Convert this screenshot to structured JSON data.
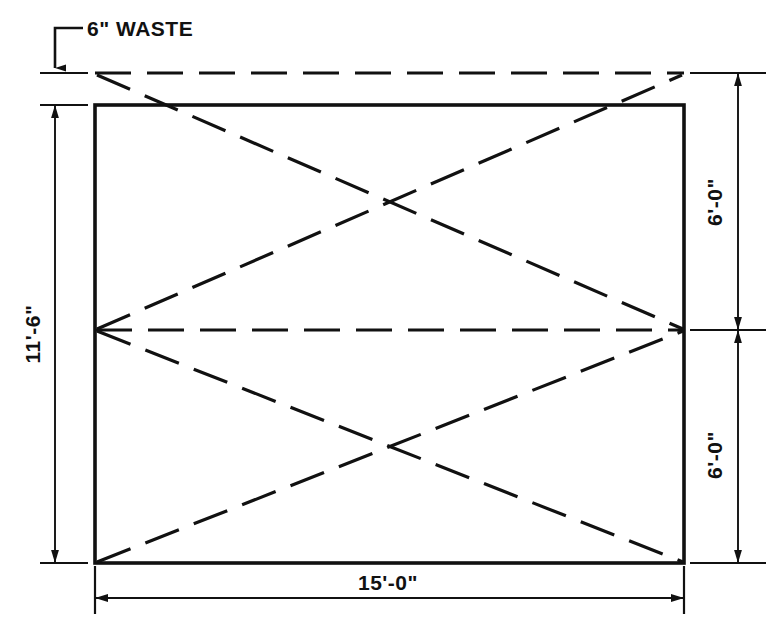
{
  "drawing": {
    "title": "Sheet metal layout with waste allowance",
    "background_color": "#ffffff",
    "line_color": "#111111",
    "annotations": {
      "waste_note": "6\" WASTE",
      "left_dimension": "11'-6\"",
      "bottom_dimension": "15'-0\"",
      "right_dimension_upper": "6'-0\"",
      "right_dimension_lower": "6'-0\""
    },
    "geometry": {
      "panel": {
        "left_x": 95,
        "right_x": 684,
        "top_y": 105,
        "bottom_y": 563,
        "style": "solid"
      },
      "waste_line": {
        "y": 73,
        "from_x": 95,
        "to_x": 684,
        "style": "dashed"
      },
      "centerline": {
        "y": 330,
        "from_x": 95,
        "to_x": 684,
        "style": "dashed"
      },
      "fold_lines_style": "dashed",
      "upper_cross_center": {
        "x": 386,
        "y": 203
      },
      "lower_cross_center": {
        "x": 388,
        "y": 446
      }
    },
    "dimension_lines": {
      "left": {
        "x": 55,
        "top_y": 105,
        "bottom_y": 563
      },
      "right": {
        "x": 738,
        "top_y": 73,
        "mid_y": 330,
        "bottom_y": 563
      },
      "bottom": {
        "y": 598,
        "left_x": 95,
        "right_x": 684
      },
      "waste_leader": {
        "x": 55,
        "top_y": 28,
        "arrow_y": 73,
        "elbow_to_x": 83
      }
    }
  }
}
